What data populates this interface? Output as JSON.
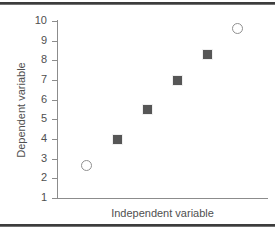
{
  "chart_data": {
    "type": "scatter",
    "title": "",
    "xlabel": "Independent variable",
    "ylabel": "Dependent variable",
    "ylim": [
      1,
      10
    ],
    "yticks": [
      10,
      9,
      8,
      7,
      6,
      5,
      4,
      3,
      2,
      1
    ],
    "ytick_labels": [
      "10",
      "9",
      "8",
      "7",
      "6",
      "5",
      "4",
      "3",
      "2",
      "1"
    ],
    "xlim": [
      0,
      7
    ],
    "xticks": [],
    "xtick_labels": [],
    "grid": false,
    "legend": null,
    "series": [
      {
        "name": "outliers",
        "marker": "open-circle",
        "color": "#909090",
        "x": [
          1,
          6
        ],
        "y": [
          2.65,
          9.6
        ]
      },
      {
        "name": "data",
        "marker": "filled-square",
        "color": "#565656",
        "x": [
          2,
          3,
          4,
          5
        ],
        "y": [
          4.0,
          5.5,
          7.0,
          8.3
        ]
      }
    ],
    "points": [
      {
        "x": 1,
        "y": 2.65,
        "marker": "open-circle"
      },
      {
        "x": 2,
        "y": 4.0,
        "marker": "filled-square"
      },
      {
        "x": 3,
        "y": 5.5,
        "marker": "filled-square"
      },
      {
        "x": 4,
        "y": 7.0,
        "marker": "filled-square"
      },
      {
        "x": 5,
        "y": 8.3,
        "marker": "filled-square"
      },
      {
        "x": 6,
        "y": 9.6,
        "marker": "open-circle"
      }
    ]
  },
  "colors": {
    "axis": "#8c8c8c",
    "text": "#4f4f4f",
    "filled_marker": "#565656",
    "open_marker": "#909090",
    "rule": "#3c3c3c",
    "background": "#ffffff"
  }
}
